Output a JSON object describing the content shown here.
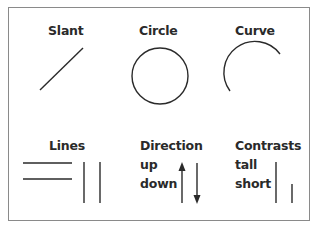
{
  "figure": {
    "panels": [
      {
        "id": "slant",
        "title": "Slant",
        "shape": "diagonal-line"
      },
      {
        "id": "circle",
        "title": "Circle",
        "shape": "circle"
      },
      {
        "id": "curve",
        "title": "Curve",
        "shape": "arc"
      },
      {
        "id": "lines",
        "title": "Lines",
        "shape": "parallel-lines"
      },
      {
        "id": "direction",
        "title": "Direction",
        "sublabels": [
          "up",
          "down"
        ],
        "shape": "arrows"
      },
      {
        "id": "contrasts",
        "title": "Contrasts",
        "sublabels": [
          "tall",
          "short"
        ],
        "shape": "tall-short-lines"
      }
    ],
    "stroke_color": "#2a2a2a",
    "border_color": "#8a8a8a"
  }
}
